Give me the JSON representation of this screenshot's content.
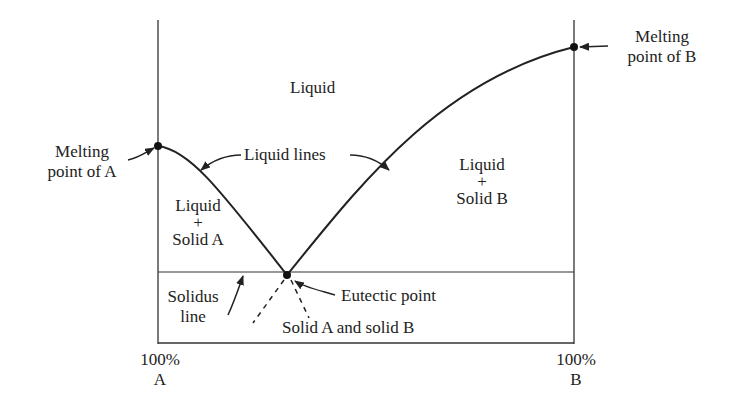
{
  "diagram": {
    "type": "eutectic phase diagram",
    "regions": {
      "liquid": "Liquid",
      "liquid_solid_a": [
        "Liquid",
        "+",
        "Solid A"
      ],
      "liquid_solid_b": [
        "Liquid",
        "+",
        "Solid B"
      ],
      "solid_a_b": "Solid A and solid B"
    },
    "annotations": {
      "melting_a": [
        "Melting",
        "point of A"
      ],
      "melting_b": [
        "Melting",
        "point of B"
      ],
      "liquid_lines": "Liquid lines",
      "solidus_line": [
        "Solidus",
        "line"
      ],
      "eutectic_point": "Eutectic point"
    },
    "axis": {
      "left": [
        "100%",
        "A"
      ],
      "right": [
        "100%",
        "B"
      ]
    },
    "colors": {
      "line": "#222222",
      "background": "#ffffff"
    }
  }
}
